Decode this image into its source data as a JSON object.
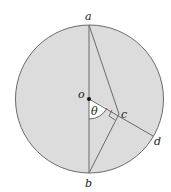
{
  "diagram": {
    "type": "circle-geometry",
    "colors": {
      "fill": "#dcdcdc",
      "stroke": "#6a6a6a",
      "text": "#222222",
      "angle_fill": "#ffffff"
    },
    "circle": {
      "cx": 89.5,
      "cy": 99,
      "r": 74
    },
    "points": {
      "a": {
        "label": "a",
        "x": 89,
        "y": 25
      },
      "b": {
        "label": "b",
        "x": 89,
        "y": 173
      },
      "o": {
        "label": "o",
        "x": 89,
        "y": 99
      },
      "c": {
        "label": "c",
        "x": 119,
        "y": 114
      },
      "d": {
        "label": "d",
        "x": 153,
        "y": 136
      }
    },
    "segments": [
      "a-b",
      "a-c",
      "o-d",
      "c-b"
    ],
    "angle": {
      "label": "θ",
      "vertex": "o",
      "between": [
        "b",
        "c"
      ]
    },
    "right_angle_at": "c"
  }
}
